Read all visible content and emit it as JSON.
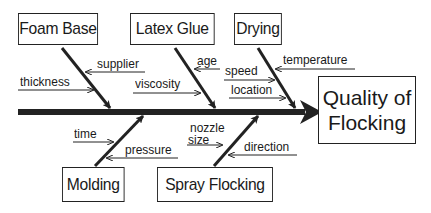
{
  "diagram": {
    "type": "fishbone",
    "effect": {
      "line1": "Quality of",
      "line2": "Flocking"
    },
    "categories": [
      {
        "name": "Foam Base",
        "causes": [
          "supplier",
          "thickness"
        ]
      },
      {
        "name": "Latex Glue",
        "causes": [
          "age",
          "viscosity"
        ]
      },
      {
        "name": "Drying",
        "causes": [
          "temperature",
          "speed",
          "location"
        ]
      },
      {
        "name": "Molding",
        "causes": [
          "time",
          "pressure"
        ]
      },
      {
        "name": "Spray Flocking",
        "causes": [
          "nozzle",
          "size",
          "direction"
        ]
      }
    ],
    "colors": {
      "line": "#222222",
      "background": "#ffffff"
    }
  }
}
